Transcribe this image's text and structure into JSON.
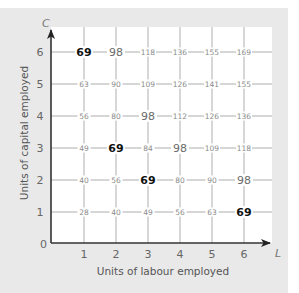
{
  "chart_data": {
    "type": "table",
    "title": "",
    "xlabel": "Units of labour employed",
    "ylabel": "Units of capital employed",
    "x_axis_letter": "L",
    "y_axis_letter": "C",
    "origin_label": "0",
    "x_ticks": [
      "1",
      "2",
      "3",
      "4",
      "5",
      "6"
    ],
    "y_ticks": [
      "1",
      "2",
      "3",
      "4",
      "5",
      "6"
    ],
    "xlim": [
      0,
      7
    ],
    "ylim": [
      0,
      6.5
    ],
    "grid": true,
    "rows": [
      {
        "capital": 6,
        "values": [
          69,
          98,
          118,
          136,
          155,
          169
        ]
      },
      {
        "capital": 5,
        "values": [
          63,
          90,
          109,
          126,
          141,
          155
        ]
      },
      {
        "capital": 4,
        "values": [
          56,
          80,
          98,
          112,
          126,
          136
        ]
      },
      {
        "capital": 3,
        "values": [
          49,
          69,
          84,
          98,
          109,
          118
        ]
      },
      {
        "capital": 2,
        "values": [
          40,
          56,
          69,
          80,
          90,
          98
        ]
      },
      {
        "capital": 1,
        "values": [
          28,
          40,
          49,
          56,
          63,
          69
        ]
      }
    ],
    "highlighted_bold_value": 69,
    "highlighted_large_value": 98,
    "colors": {
      "background": "#e9e9e9",
      "plot_background": "#ffffff",
      "axis": "#333333",
      "grid": "#9a9a9a",
      "bold_value": "#111111",
      "value": "#8a8a8a"
    }
  }
}
